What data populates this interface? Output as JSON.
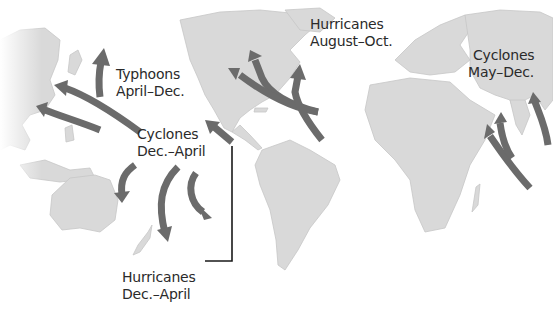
{
  "map": {
    "title": "Tropical cyclone tracks and seasons",
    "colors": {
      "land": "#d9d9d9",
      "arrow": "#6b6b6b",
      "text": "#2a2a2a",
      "background": "#ffffff",
      "leader_line": "#1a1a1a"
    },
    "labels": [
      {
        "id": "typhoons",
        "line1": "Typhoons",
        "line2": "April–Dec."
      },
      {
        "id": "cyclones_south_pacific",
        "line1": "Cyclones",
        "line2": "Dec.–April"
      },
      {
        "id": "hurricanes_atlantic",
        "line1": "Hurricanes",
        "line2": "August–Oct."
      },
      {
        "id": "cyclones_indian",
        "line1": "Cyclones",
        "line2": "May–Dec."
      },
      {
        "id": "hurricanes_south_pacific",
        "line1": "Hurricanes",
        "line2": "Dec.–April"
      }
    ],
    "regions": [
      "North America",
      "South America",
      "Europe",
      "Africa",
      "Asia",
      "Australia",
      "New Zealand",
      "Madagascar",
      "India"
    ]
  }
}
